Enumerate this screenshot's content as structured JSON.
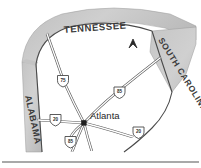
{
  "map": {
    "title": "Atlanta regional interstate map",
    "states": [
      {
        "id": "tennessee",
        "label": "TENNESSEE",
        "position": "north"
      },
      {
        "id": "south-carolina",
        "label": "SOUTH CAROLINA",
        "position": "northeast"
      },
      {
        "id": "alabama",
        "label": "ALABAMA",
        "position": "west"
      }
    ],
    "cities": [
      {
        "id": "atlanta",
        "label": "Atlanta"
      }
    ],
    "highways": [
      {
        "id": "i-75",
        "shield": "75",
        "direction": "northwest"
      },
      {
        "id": "i-85-north",
        "shield": "85",
        "direction": "northeast"
      },
      {
        "id": "i-20-west",
        "shield": "20",
        "direction": "west"
      },
      {
        "id": "i-20-east",
        "shield": "20",
        "direction": "east"
      },
      {
        "id": "i-85-south",
        "shield": "85",
        "direction": "south"
      }
    ],
    "marker": {
      "id": "north-arrow",
      "glyph": "caret-up"
    },
    "colors": {
      "state_fill": "#c9c9c9",
      "georgia_fill": "#ffffff",
      "road_casing": "#5d5d5d",
      "road_fill": "#ffffff",
      "text": "#2a2a2a",
      "border": "#4a4a4a"
    }
  }
}
